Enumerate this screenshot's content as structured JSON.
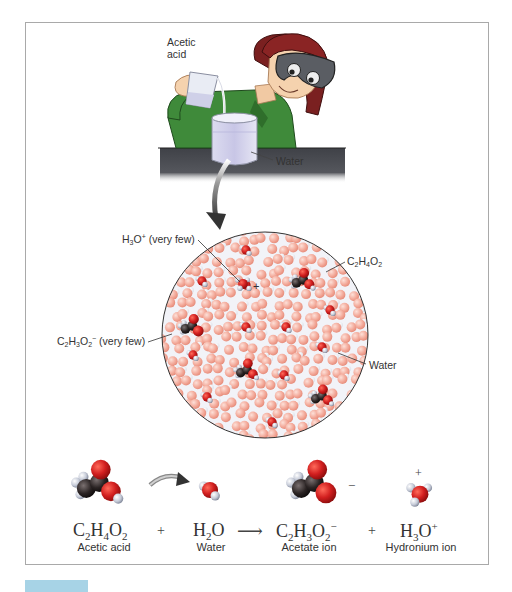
{
  "scene": {
    "top_labels": {
      "acetic_acid": [
        "Acetic",
        "acid"
      ],
      "water": "Water"
    },
    "magnified_view": {
      "labels": {
        "hydronium": {
          "formula": [
            "H",
            "3",
            "O",
            "+"
          ],
          "note": "(very few)"
        },
        "acetic_acid": {
          "formula": [
            "C",
            "2",
            "H",
            "4",
            "O",
            "2"
          ]
        },
        "acetate": {
          "formula": [
            "C",
            "2",
            "H",
            "3",
            "O",
            "2",
            "−"
          ],
          "note": "(very few)"
        },
        "water": "Water"
      },
      "hydronium_charge": "+"
    }
  },
  "equation": {
    "reactants": [
      {
        "formula": [
          "C",
          "2",
          "H",
          "4",
          "O",
          "2"
        ],
        "name": "Acetic acid"
      },
      {
        "formula": [
          "H",
          "2",
          "O"
        ],
        "name": "Water"
      }
    ],
    "products": [
      {
        "formula": [
          "C",
          "2",
          "H",
          "3",
          "O",
          "2"
        ],
        "charge": "−",
        "name": "Acetate ion"
      },
      {
        "formula": [
          "H",
          "3",
          "O"
        ],
        "charge": "+",
        "name": "Hydronium ion"
      }
    ],
    "plus_sign": "+",
    "arrow": "⟶"
  },
  "colors": {
    "oxygen": "#d21f1f",
    "carbon": "#2b2424",
    "hydrogen": "#d7dbe6",
    "water_oxygen_faded": "#f2a696",
    "bench": "#4d4f55",
    "shirt": "#3f8a3a",
    "hair": "#7a2020",
    "frame": "#a9a9a9",
    "figure_tab": "#a7d3e6"
  }
}
